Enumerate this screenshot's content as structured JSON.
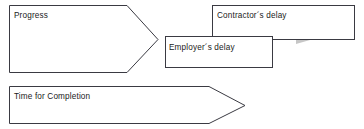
{
  "diagram": {
    "background_color": "#ffffff",
    "outline_color": "#3a3a42",
    "gray_arrow_color": "#c6c6c6",
    "text_color": "#1a1a1a",
    "shapes": [
      {
        "id": "progress",
        "label": "Progress",
        "type": "pentagon-arrow",
        "fill": "#ffffff",
        "x": 9,
        "y": 5,
        "width": 149,
        "height": 68
      },
      {
        "id": "contractors-delay",
        "label": "Contractor´s delay",
        "type": "rectangle",
        "fill": "#ffffff",
        "x": 212,
        "y": 5,
        "width": 143,
        "height": 35
      },
      {
        "id": "employers-delay",
        "label": "Employer´s delay",
        "type": "rectangle",
        "fill": "#ffffff",
        "x": 165,
        "y": 36,
        "width": 108,
        "height": 32
      },
      {
        "id": "time-for-completion",
        "label": "Time for Completion",
        "type": "pentagon-arrow",
        "fill": "#ffffff",
        "x": 9,
        "y": 86,
        "width": 236,
        "height": 38
      }
    ],
    "gray_arrow": {
      "id": "delay-step-arrow",
      "description": "gray stepped block arrow pointing right behind the delay boxes",
      "color": "#c6c6c6"
    }
  }
}
